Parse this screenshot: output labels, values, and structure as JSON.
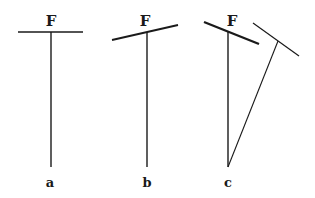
{
  "figure": {
    "panels": [
      {
        "id": "a",
        "label": "a",
        "force_label": "F",
        "bar": {
          "x1": 18,
          "y1": 32,
          "x2": 83,
          "y2": 32,
          "width": 1.6
        },
        "stem": {
          "x1": 51,
          "y1": 32,
          "x2": 51,
          "y2": 167
        },
        "force_pos": {
          "x": 51,
          "y": 26
        },
        "label_pos": {
          "x": 50,
          "y": 187
        }
      },
      {
        "id": "b",
        "label": "b",
        "force_label": "F",
        "bar": {
          "x1": 112,
          "y1": 40,
          "x2": 178,
          "y2": 25,
          "width": 1.8
        },
        "stem": {
          "x1": 147,
          "y1": 32,
          "x2": 147,
          "y2": 167
        },
        "force_pos": {
          "x": 145,
          "y": 26
        },
        "label_pos": {
          "x": 147,
          "y": 187
        }
      },
      {
        "id": "c",
        "label": "c",
        "force_label": "F",
        "bar": {
          "x1": 204,
          "y1": 22,
          "x2": 259,
          "y2": 44,
          "width": 2.4
        },
        "stem": {
          "x1": 228,
          "y1": 32,
          "x2": 228,
          "y2": 167
        },
        "secondary_bar": {
          "x1": 253,
          "y1": 23,
          "x2": 299,
          "y2": 56,
          "width": 1.2
        },
        "secondary_stem": {
          "x1": 228,
          "y1": 167,
          "x2": 278,
          "y2": 41
        },
        "force_pos": {
          "x": 232,
          "y": 26
        },
        "label_pos": {
          "x": 228,
          "y": 187
        }
      }
    ],
    "stroke_color": "#1a1a1a"
  }
}
